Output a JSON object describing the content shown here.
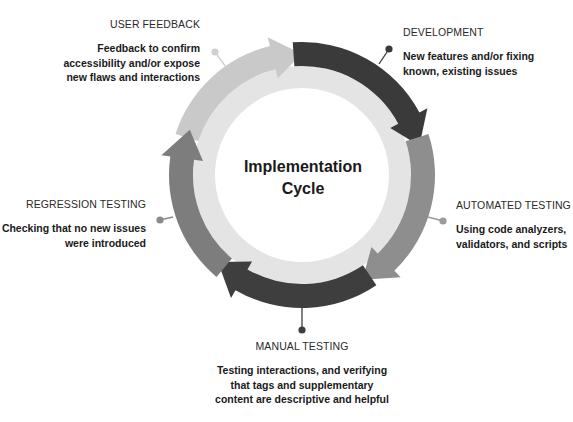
{
  "diagram": {
    "center_title": [
      "Implementation",
      "Cycle"
    ],
    "geometry": {
      "cx": 302,
      "cy": 175,
      "outer_r": 133,
      "band_inner_r": 109,
      "pale_inner_r": 87
    },
    "colors": {
      "pale_ring": "#e4e4e4",
      "background": "#ffffff",
      "text": "#1a1a1a"
    },
    "stages": [
      {
        "id": "user-feedback",
        "title": "USER FEEDBACK",
        "description": [
          "Feedback to confirm",
          "accessibility and/or expose",
          "new flaws and interactions"
        ],
        "color": "#c9c9c9",
        "arc_start_deg": 200,
        "arc_end_deg": 268,
        "dot": {
          "x": 215,
          "y": 52,
          "to_x": 226,
          "to_y": 67,
          "color": "#cfcfcf"
        },
        "label": {
          "x": 200,
          "y": 18,
          "align": "right"
        }
      },
      {
        "id": "development",
        "title": "DEVELOPMENT",
        "description": [
          "New features and/or fixing",
          "known, existing issues"
        ],
        "color": "#3a3a3a",
        "arc_start_deg": 268,
        "arc_end_deg": 344,
        "dot": {
          "x": 389,
          "y": 49,
          "to_x": 379,
          "to_y": 64,
          "color": "#3a3a3a"
        },
        "label": {
          "x": 403,
          "y": 26,
          "align": "left"
        }
      },
      {
        "id": "automated-testing",
        "title": "AUTOMATED TESTING",
        "description": [
          "Using code analyzers,",
          "validators, and scripts"
        ],
        "color": "#8e8e8e",
        "arc_start_deg": 344,
        "arc_end_deg": 58,
        "dot": {
          "x": 443,
          "y": 221,
          "to_x": 428,
          "to_y": 217,
          "color": "#9a9a9a"
        },
        "label": {
          "x": 456,
          "y": 199,
          "align": "left"
        }
      },
      {
        "id": "manual-testing",
        "title": "MANUAL TESTING",
        "description": [
          "Testing interactions, and verifying",
          "that tags and supplementary",
          "content are descriptive and helpful"
        ],
        "color": "#3e3e3e",
        "arc_start_deg": 58,
        "arc_end_deg": 132,
        "dot": {
          "x": 302,
          "y": 330,
          "to_x": 302,
          "to_y": 308,
          "color": "#3e3e3e"
        },
        "label": {
          "x": 302,
          "y": 340,
          "align": "center"
        }
      },
      {
        "id": "regression-testing",
        "title": "REGRESSION TESTING",
        "description": [
          "Checking that no new issues",
          "were introduced"
        ],
        "color": "#7d7d7d",
        "arc_start_deg": 132,
        "arc_end_deg": 200,
        "dot": {
          "x": 160,
          "y": 220,
          "to_x": 173,
          "to_y": 217,
          "color": "#8a8a8a"
        },
        "label": {
          "x": 146,
          "y": 198,
          "align": "right"
        }
      }
    ]
  }
}
